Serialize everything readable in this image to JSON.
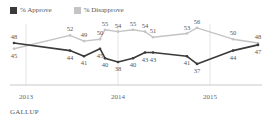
{
  "chart_data": {
    "type": "line",
    "title": "",
    "xlabel": "",
    "ylabel": "",
    "x_ticks": [
      "2013",
      "2014",
      "2015"
    ],
    "grid": false,
    "legend_position": "top-left",
    "series": [
      {
        "name": "% Approve",
        "color": "#3a3a3a",
        "values": [
          48,
          44,
          41,
          45,
          40,
          38,
          40,
          43,
          43,
          41,
          37,
          44,
          47
        ]
      },
      {
        "name": "% Disapprove",
        "color": "#bdbdbd",
        "values": [
          45,
          52,
          49,
          50,
          55,
          54,
          55,
          54,
          51,
          53,
          56,
          50,
          48
        ]
      }
    ],
    "x_positions_px": [
      14,
      70,
      84,
      100,
      105,
      118,
      133,
      145,
      153,
      187,
      197,
      233,
      258
    ]
  },
  "legend": {
    "approve_label": "% Approve",
    "disapprove_label": "% Disapprove",
    "approve_color": "#3a3a3a",
    "disapprove_color": "#c4c4c4"
  },
  "axis": {
    "years": [
      {
        "label": "2013",
        "x": 26
      },
      {
        "label": "2014",
        "x": 118
      },
      {
        "label": "2015",
        "x": 210
      }
    ]
  },
  "source": "GALLUP"
}
